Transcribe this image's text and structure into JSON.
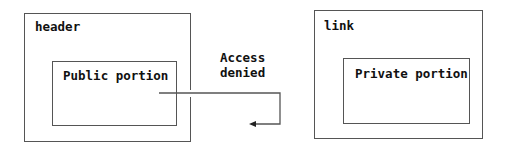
{
  "diagram": {
    "left_outer": {
      "label": "header"
    },
    "left_inner": {
      "label": "Public portion"
    },
    "right_outer": {
      "label": "link"
    },
    "right_inner": {
      "label": "Private portion"
    },
    "connector": {
      "label_line1": "Access",
      "label_line2": "denied",
      "arrow": "arrow-left-icon"
    },
    "colors": {
      "line": "#555555",
      "text": "#111111",
      "background": "#ffffff"
    }
  }
}
